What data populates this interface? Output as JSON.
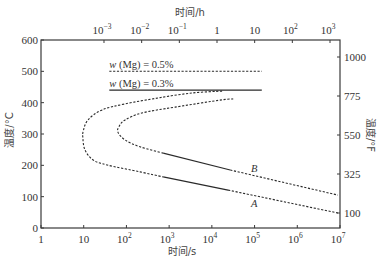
{
  "chart_data": {
    "type": "line",
    "title": "",
    "xlabel": "时间/s",
    "x2label": "时间/h",
    "ylabel": "温度/°C",
    "y2label": "温度/°F",
    "xscale": "log",
    "xlim_log10_s": [
      0,
      7
    ],
    "ylim": [
      0,
      600
    ],
    "grid": false,
    "legend": "none",
    "x_ticks": [
      {
        "base": "1",
        "exp": ""
      },
      {
        "base": "10",
        "exp": ""
      },
      {
        "base": "10",
        "exp": "2"
      },
      {
        "base": "10",
        "exp": "3"
      },
      {
        "base": "10",
        "exp": "4"
      },
      {
        "base": "10",
        "exp": "5"
      },
      {
        "base": "10",
        "exp": "6"
      },
      {
        "base": "10",
        "exp": "7"
      }
    ],
    "x2_ticks": [
      {
        "base": "10",
        "exp": "−3",
        "power": -3
      },
      {
        "base": "10",
        "exp": "−2",
        "power": -2
      },
      {
        "base": "10",
        "exp": "−1",
        "power": -1
      },
      {
        "base": "1",
        "exp": "",
        "power": 0
      },
      {
        "base": "10",
        "exp": "",
        "power": 1
      },
      {
        "base": "10",
        "exp": "2",
        "power": 2
      },
      {
        "base": "10",
        "exp": "3",
        "power": 3
      }
    ],
    "y_ticks": [
      0,
      100,
      200,
      300,
      400,
      500,
      600
    ],
    "y2_ticks": [
      100,
      325,
      550,
      775,
      1000
    ],
    "series": [
      {
        "name": "A",
        "label": "A",
        "label_pos": {
          "log10_t": 4.99,
          "temp_c": 80
        },
        "segments": [
          {
            "style": "dashed",
            "points": [
              [
                4.24,
                437
              ],
              [
                3.54,
                431
              ],
              [
                2.74,
                415
              ],
              [
                1.97,
                396
              ],
              [
                1.43,
                377
              ],
              [
                1.1,
                345
              ],
              [
                0.99,
                310
              ],
              [
                0.98,
                287
              ],
              [
                1.03,
                249
              ],
              [
                1.22,
                217
              ],
              [
                1.55,
                201
              ],
              [
                2.32,
                179
              ],
              [
                2.86,
                163
              ]
            ]
          },
          {
            "style": "solid",
            "points": [
              [
                2.86,
                163
              ],
              [
                4.38,
                121
              ]
            ]
          },
          {
            "style": "dashed",
            "points": [
              [
                4.38,
                121
              ],
              [
                6.95,
                48
              ]
            ]
          }
        ]
      },
      {
        "name": "B",
        "label": "B",
        "label_pos": {
          "log10_t": 4.99,
          "temp_c": 191
        },
        "segments": [
          {
            "style": "dashed",
            "points": [
              [
                4.5,
                412
              ],
              [
                4.24,
                409
              ],
              [
                3.14,
                386
              ],
              [
                2.36,
                367
              ],
              [
                1.97,
                345
              ],
              [
                1.83,
                325
              ],
              [
                1.8,
                306
              ],
              [
                1.97,
                281
              ],
              [
                2.32,
                259
              ],
              [
                2.86,
                239
              ]
            ]
          },
          {
            "style": "solid",
            "points": [
              [
                2.86,
                239
              ],
              [
                4.43,
                185
              ]
            ]
          },
          {
            "style": "dashed",
            "points": [
              [
                4.43,
                185
              ],
              [
                6.95,
                105
              ]
            ]
          }
        ]
      },
      {
        "name": "w (Mg) = 0.5%",
        "label": "w (Mg) = 0.5%",
        "label_pos": {
          "log10_t": 1.6,
          "temp_c": 522
        },
        "segments": [
          {
            "style": "dashed",
            "points": [
              [
                1.6,
                500
              ],
              [
                5.17,
                500
              ]
            ]
          }
        ]
      },
      {
        "name": "w (Mg) = 0.3%",
        "label": "w (Mg) = 0.3%",
        "label_pos": {
          "log10_t": 1.6,
          "temp_c": 462
        },
        "segments": [
          {
            "style": "solid",
            "points": [
              [
                1.6,
                440
              ],
              [
                5.17,
                440
              ]
            ]
          }
        ]
      }
    ]
  }
}
